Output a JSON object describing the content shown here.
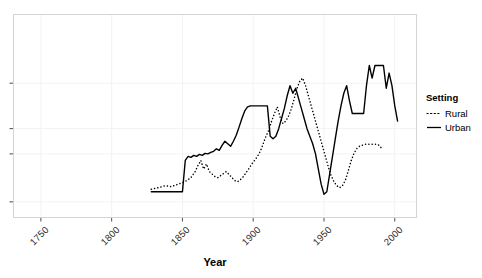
{
  "chart_data": {
    "type": "line",
    "title": "",
    "xlabel": "Year",
    "ylabel": "",
    "xlim": [
      1731,
      2015
    ],
    "ylim": [
      0,
      4
    ],
    "grid": true,
    "grid_color": "#f2f2f2",
    "panel_border_color": "#d4d4d4",
    "legend": {
      "title": "Setting",
      "position": "right",
      "entries": [
        {
          "name": "Rural",
          "style": "dotted",
          "color": "#000000"
        },
        {
          "name": "Urban",
          "style": "solid",
          "color": "#000000"
        }
      ]
    },
    "xticks": [
      1750,
      1800,
      1850,
      1900,
      1950,
      2000
    ],
    "xtick_labels": [
      "1750",
      "1800",
      "1850",
      "1900",
      "1950",
      "2000"
    ],
    "yticks": [
      0.3,
      1.25,
      1.75,
      2.65
    ],
    "ytick_labels": [
      "",
      "",
      "",
      ""
    ],
    "ytick_labels_clipped": true,
    "series": [
      {
        "name": "Rural",
        "style": "dotted",
        "color": "#000000",
        "x": [
          1828,
          1833,
          1838,
          1842,
          1846,
          1850,
          1853,
          1856,
          1859,
          1861,
          1863,
          1865,
          1867,
          1869,
          1871,
          1873,
          1875,
          1877,
          1879,
          1881,
          1883,
          1885,
          1887,
          1889,
          1891,
          1893,
          1895,
          1897,
          1899,
          1901,
          1903,
          1905,
          1907,
          1909,
          1911,
          1913,
          1915,
          1917,
          1919,
          1921,
          1923,
          1925,
          1927,
          1929,
          1931,
          1933,
          1935,
          1937,
          1939,
          1941,
          1943,
          1945,
          1947,
          1949,
          1951,
          1953,
          1955,
          1957,
          1959,
          1961,
          1963,
          1965,
          1967,
          1969,
          1971,
          1973,
          1975,
          1977,
          1979,
          1981,
          1983,
          1985,
          1987,
          1989,
          1991
        ],
        "y": [
          0.55,
          0.58,
          0.62,
          0.6,
          0.64,
          0.68,
          0.72,
          0.78,
          0.9,
          1.02,
          1.12,
          0.95,
          1.05,
          0.9,
          0.85,
          0.8,
          0.78,
          0.82,
          0.86,
          0.9,
          0.84,
          0.78,
          0.72,
          0.7,
          0.74,
          0.8,
          0.88,
          0.96,
          1.05,
          1.12,
          1.2,
          1.3,
          1.45,
          1.6,
          1.72,
          1.9,
          2.05,
          2.18,
          1.98,
          1.85,
          1.9,
          2.0,
          2.15,
          2.35,
          2.55,
          2.7,
          2.75,
          2.6,
          2.4,
          2.2,
          2.0,
          1.8,
          1.6,
          1.4,
          1.2,
          1.0,
          0.82,
          0.7,
          0.62,
          0.58,
          0.62,
          0.72,
          0.9,
          1.1,
          1.25,
          1.35,
          1.4,
          1.42,
          1.44,
          1.44,
          1.44,
          1.44,
          1.44,
          1.42,
          1.35
        ]
      },
      {
        "name": "Urban",
        "style": "solid",
        "color": "#000000",
        "x": [
          1828,
          1836,
          1844,
          1850,
          1852,
          1854,
          1856,
          1858,
          1860,
          1862,
          1864,
          1866,
          1868,
          1870,
          1872,
          1874,
          1876,
          1878,
          1880,
          1882,
          1884,
          1886,
          1888,
          1890,
          1892,
          1894,
          1896,
          1898,
          1900,
          1902,
          1904,
          1906,
          1908,
          1910,
          1912,
          1914,
          1916,
          1918,
          1920,
          1922,
          1924,
          1926,
          1928,
          1930,
          1932,
          1934,
          1936,
          1938,
          1940,
          1942,
          1944,
          1946,
          1948,
          1950,
          1952,
          1954,
          1956,
          1958,
          1960,
          1962,
          1964,
          1966,
          1968,
          1970,
          1972,
          1974,
          1976,
          1978,
          1980,
          1982,
          1984,
          1986,
          1988,
          1990,
          1992,
          1994,
          1996,
          1998,
          2000,
          2002
        ],
        "y": [
          0.5,
          0.5,
          0.5,
          0.5,
          1.12,
          1.2,
          1.18,
          1.22,
          1.2,
          1.24,
          1.22,
          1.26,
          1.25,
          1.28,
          1.3,
          1.35,
          1.32,
          1.42,
          1.5,
          1.45,
          1.4,
          1.5,
          1.62,
          1.78,
          1.95,
          2.1,
          2.18,
          2.2,
          2.2,
          2.2,
          2.2,
          2.2,
          2.2,
          2.2,
          1.6,
          1.55,
          1.6,
          1.75,
          1.95,
          2.15,
          2.4,
          2.6,
          2.45,
          2.55,
          2.35,
          2.15,
          1.95,
          1.75,
          1.6,
          1.45,
          1.25,
          0.95,
          0.65,
          0.45,
          0.5,
          0.85,
          1.2,
          1.55,
          1.9,
          2.2,
          2.45,
          2.6,
          2.3,
          2.05,
          2.05,
          2.05,
          2.05,
          2.05,
          2.6,
          3.0,
          2.75,
          3.0,
          3.0,
          3.0,
          3.0,
          2.55,
          2.85,
          2.6,
          2.2,
          1.9
        ]
      }
    ]
  }
}
